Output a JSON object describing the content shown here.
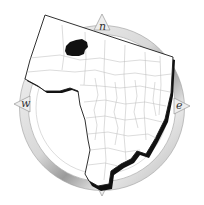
{
  "map": {
    "type": "state-outline-with-counties",
    "highlighted_region": {
      "description": "single county filled solid black in northwest area",
      "fill": "#111111"
    },
    "outline_color": "#1a1a1a",
    "county_border_color": "#b8b8b8",
    "land_fill": "#ffffff",
    "shadow_color": "#111111"
  },
  "compass": {
    "labels": {
      "north": "n",
      "west": "w",
      "east": "e"
    },
    "ring_color": "#bdbdbd",
    "ring_shade": "#8a8a8a"
  }
}
